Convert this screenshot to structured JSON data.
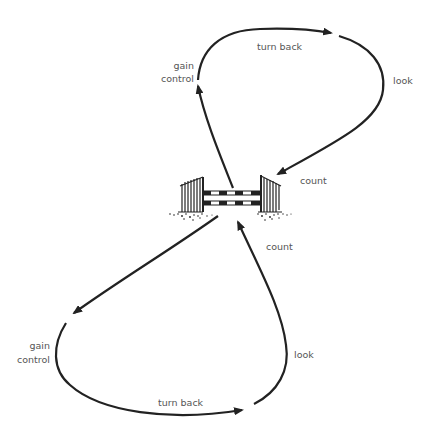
{
  "diagram": {
    "type": "figure-eight jumping exercise",
    "stroke_color": "#222222",
    "label_color": "#555555",
    "labels": {
      "top_turn_back": "turn back",
      "top_look": "look",
      "top_gain_control_line1": "gain",
      "top_gain_control_line2": "control",
      "top_count": "count",
      "bottom_count": "count",
      "bottom_look": "look",
      "bottom_gain_control_line1": "gain",
      "bottom_gain_control_line2": "control",
      "bottom_turn_back": "turn back"
    },
    "elements": [
      "show-jump-fence",
      "top-loop-path",
      "bottom-loop-path"
    ]
  }
}
